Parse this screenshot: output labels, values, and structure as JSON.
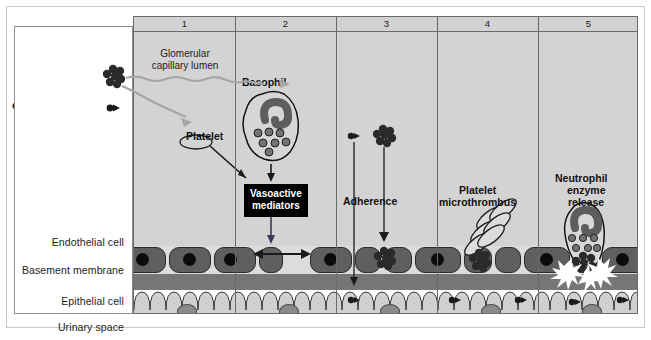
{
  "figure": {
    "title_row_numbers": [
      "1",
      "2",
      "3",
      "4",
      "5"
    ],
    "row_labels": [
      "Endothelial cell",
      "Basement membrane",
      "Epithelial cell",
      "Urinary space"
    ],
    "legend": {
      "title_line1": "Immune",
      "title_line2": "complexes",
      "large_label": "Large",
      "small_label": "Small"
    },
    "panel1": {
      "lumen_label_line1": "Glomerular",
      "lumen_label_line2": "capillary lumen",
      "platelet_label": "Platelet"
    },
    "panel2": {
      "basophil_label": "Basophil",
      "mediators_line1": "Vasoactive",
      "mediators_line2": "mediators"
    },
    "panel3": {
      "adherence_label": "Adherence"
    },
    "panel4": {
      "microthrombus_line1": "Platelet",
      "microthrombus_line2": "microthrombus"
    },
    "panel5": {
      "neutrophil_line1": "Neutrophil",
      "neutrophil_line2": "enzyme",
      "neutrophil_line3": "release"
    },
    "colors": {
      "lumen": "#d3d3d3",
      "endothelium_band": "#dcdcdc",
      "endothelial_cell": "#5f5f5f",
      "endothelial_nucleus": "#0c0c0c",
      "basement_membrane": "#767676",
      "epithelium": "#d0d0d0",
      "epithelial_nucleus": "#8b8b8b",
      "urinary_space": "#e4e4e4",
      "header": "#d2d2d2",
      "outline": "#6a6a6a",
      "mediator_box_bg": "#000000",
      "mediator_box_text": "#ffffff"
    }
  }
}
